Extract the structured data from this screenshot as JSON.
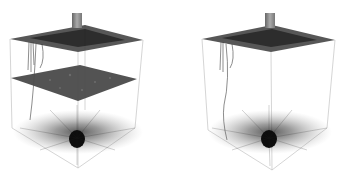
{
  "figure": {
    "panels": [
      {
        "id": "left",
        "description": "3D volume rendering with top plane, mid cross-section plane, and radial fiber burst at bottom",
        "has_mid_plane": true
      },
      {
        "id": "right",
        "description": "3D volume rendering with top plane and radial fiber burst at bottom, no mid plane",
        "has_mid_plane": false
      }
    ],
    "colors": {
      "background": "#ffffff",
      "dark_fiber": "#1a1a1a",
      "plane": "#4a4a4a",
      "edge": "#9a9a9a",
      "chimney": "#8a8a8a"
    }
  }
}
